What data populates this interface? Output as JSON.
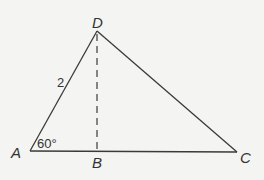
{
  "diagram": {
    "type": "triangle",
    "points": {
      "A": {
        "label": "A",
        "x": 30,
        "y": 151
      },
      "B": {
        "label": "B",
        "x": 97,
        "y": 151
      },
      "C": {
        "label": "C",
        "x": 237,
        "y": 152
      },
      "D": {
        "label": "D",
        "x": 97,
        "y": 31
      }
    },
    "edges": [
      {
        "from": "A",
        "to": "D",
        "style": "solid",
        "label": "2"
      },
      {
        "from": "D",
        "to": "C",
        "style": "solid"
      },
      {
        "from": "A",
        "to": "C",
        "style": "solid"
      },
      {
        "from": "D",
        "to": "B",
        "style": "dashed"
      }
    ],
    "angle_label": "60°",
    "side_label": "2",
    "line_color": "#3a3a3a",
    "background": "#f4f4f2"
  }
}
